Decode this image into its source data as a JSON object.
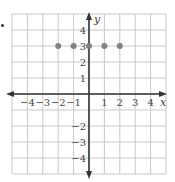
{
  "chart_data": {
    "type": "scatter",
    "title": "",
    "xlabel": "x",
    "ylabel": "y",
    "xlim": [
      -5,
      5
    ],
    "ylim": [
      -5,
      5
    ],
    "grid": true,
    "x_ticks": [
      -4,
      -3,
      -2,
      -1,
      1,
      2,
      3,
      4
    ],
    "y_ticks": [
      4,
      3,
      2,
      1,
      -2,
      -3,
      -4
    ],
    "series": [
      {
        "name": "points",
        "color": "#808080",
        "points": [
          {
            "x": -2,
            "y": 3
          },
          {
            "x": -1,
            "y": 3
          },
          {
            "x": 0,
            "y": 3
          },
          {
            "x": 1,
            "y": 3
          },
          {
            "x": 2,
            "y": 3
          }
        ]
      }
    ]
  },
  "labels": {
    "x_axis": "x",
    "y_axis": "y",
    "x_tick_labels": [
      "−4",
      "−3",
      "−2",
      "−1",
      "1",
      "2",
      "3",
      "4"
    ],
    "y_tick_labels": [
      "4",
      "3",
      "2",
      "1",
      "−2",
      "−3",
      "−4"
    ]
  },
  "colors": {
    "grid": "#c8c8c8",
    "axis": "#333333",
    "point": "#808080",
    "text": "#444444"
  }
}
